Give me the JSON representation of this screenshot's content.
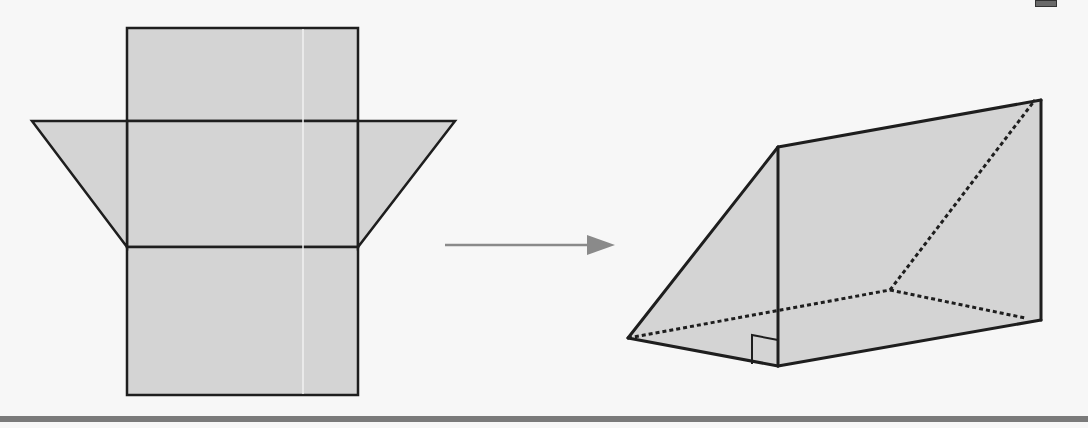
{
  "figure": {
    "colors": {
      "background": "#f7f7f7",
      "face_fill": "#d4d4d4",
      "edge": "#1e1e1e",
      "arrow": "#8a8a8a",
      "highlight_line": "#f2f2f2",
      "bottom_bar": "#7a7a7a"
    },
    "net": {
      "label": "",
      "faces": [
        {
          "name": "top-rectangle",
          "points": [
            [
              127,
              28
            ],
            [
              358,
              28
            ],
            [
              358,
              121
            ],
            [
              127,
              121
            ]
          ]
        },
        {
          "name": "middle-rectangle",
          "points": [
            [
              127,
              121
            ],
            [
              358,
              121
            ],
            [
              358,
              247
            ],
            [
              127,
              247
            ]
          ]
        },
        {
          "name": "bottom-rectangle",
          "points": [
            [
              127,
              247
            ],
            [
              358,
              247
            ],
            [
              358,
              395
            ],
            [
              127,
              395
            ]
          ]
        },
        {
          "name": "left-triangle",
          "points": [
            [
              32,
              121
            ],
            [
              127,
              121
            ],
            [
              127,
              247
            ]
          ]
        },
        {
          "name": "right-triangle",
          "points": [
            [
              358,
              121
            ],
            [
              455,
              121
            ],
            [
              358,
              247
            ]
          ]
        }
      ],
      "highlight_x": 303
    },
    "arrow": {
      "x1": 445,
      "y1": 245,
      "x2": 615,
      "y2": 245,
      "direction": "right"
    },
    "prism": {
      "visible_edges": [
        [
          [
            628,
            338
          ],
          [
            778,
            147
          ]
        ],
        [
          [
            778,
            147
          ],
          [
            778,
            366
          ]
        ],
        [
          [
            628,
            338
          ],
          [
            778,
            366
          ]
        ],
        [
          [
            778,
            147
          ],
          [
            1041,
            100
          ]
        ],
        [
          [
            1041,
            100
          ],
          [
            1041,
            320
          ]
        ],
        [
          [
            778,
            366
          ],
          [
            1041,
            320
          ]
        ]
      ],
      "hidden_edges": [
        [
          [
            628,
            338
          ],
          [
            890,
            290
          ]
        ],
        [
          [
            890,
            290
          ],
          [
            1025,
            318
          ]
        ],
        [
          [
            890,
            290
          ],
          [
            1035,
            100
          ]
        ]
      ],
      "right_angle_marker": {
        "x": 752,
        "y": 335,
        "size": 26
      }
    }
  }
}
